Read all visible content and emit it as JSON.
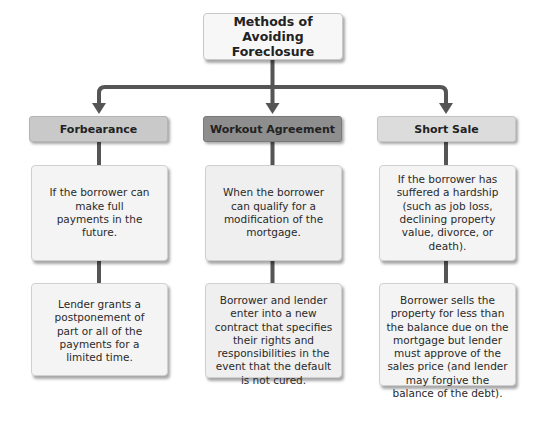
{
  "title": "Methods of Avoiding Foreclosure",
  "title_lines": [
    "Methods of",
    "Avoiding Foreclosure"
  ],
  "colors": {
    "connector": "#555555",
    "header_forbearance": "#c9c9c9",
    "header_workout": "#8e8e8e",
    "header_short_sale": "#dcdcdc",
    "card_bg": "#f4f4f4"
  },
  "branches": [
    {
      "header": "Forbearance",
      "condition": "If the borrower can make full payments in the future.",
      "outcome": "Lender grants a postponement of part or all of the payments for a limited time."
    },
    {
      "header": "Workout Agreement",
      "condition": "When the borrower can qualify for a modification of the mortgage.",
      "outcome": "Borrower and lender enter into a new contract that specifies their rights and responsibilities in the event that the default is not cured."
    },
    {
      "header": "Short Sale",
      "condition": "If the borrower has suffered a hardship (such as job loss, declining property value, divorce, or death).",
      "outcome": "Borrower sells the property for less than the balance due on the mortgage but lender must approve of the sales price (and lender may forgive the balance of the debt)."
    }
  ]
}
